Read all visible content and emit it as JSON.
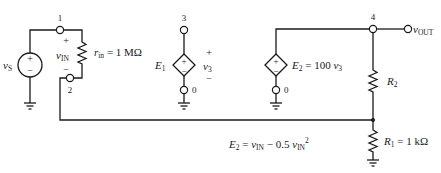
{
  "diagram": {
    "type": "circuit-schematic",
    "nodes": {
      "n1": "1",
      "n2": "2",
      "n3": "3",
      "n4": "4",
      "n0_e1": "0",
      "n0_e2": "0"
    },
    "source_vs": {
      "symbol": "v",
      "subscript": "S",
      "plus": "+",
      "minus": "−"
    },
    "input_voltage": {
      "plus": "+",
      "symbol": "v",
      "subscript": "IN",
      "minus": "−"
    },
    "rin": {
      "symbol": "r",
      "subscript": "in",
      "value": " = 1 MΩ"
    },
    "e1": {
      "symbol": "E",
      "subscript": "1",
      "plus": "+",
      "minus": "−"
    },
    "v3": {
      "plus": "+",
      "symbol": "v",
      "subscript": "3",
      "minus": "−"
    },
    "e2": {
      "symbol": "E",
      "subscript": "2",
      "value": " = 100 ",
      "var": "v",
      "var_sub": "3",
      "plus": "+",
      "minus": "−"
    },
    "output": {
      "symbol": "v",
      "subscript": "OUT"
    },
    "r2": {
      "symbol": "R",
      "subscript": "2"
    },
    "r1": {
      "symbol": "R",
      "subscript": "1",
      "value": " = 1 kΩ"
    },
    "equation": {
      "lhs": "E",
      "lhs_sub": "2",
      "eq": " = ",
      "t1": "v",
      "t1_sub": "IN",
      "op": " − 0.5 ",
      "t2": "v",
      "t2_sub": "IN",
      "exp": "2"
    }
  }
}
